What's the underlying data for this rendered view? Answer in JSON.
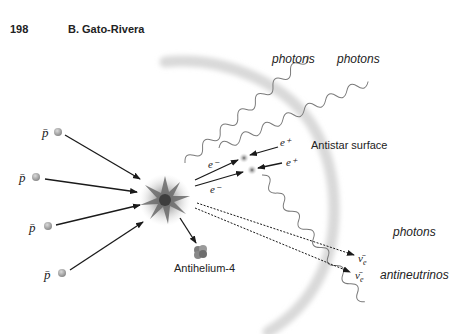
{
  "header": {
    "page_number": "198",
    "author": "B. Gato-Rivera"
  },
  "diagram": {
    "incoming_particles": [
      {
        "label": "p̄",
        "x": 47,
        "y": 135
      },
      {
        "label": "p̄",
        "x": 25,
        "y": 176
      },
      {
        "label": "p̄",
        "x": 35,
        "y": 227
      },
      {
        "label": "p̄",
        "x": 50,
        "y": 274
      }
    ],
    "annihilation_center": {
      "x": 165,
      "y": 200
    },
    "product": {
      "label": "Antihelium-4"
    },
    "electrons": [
      {
        "label": "e⁻",
        "x": 210,
        "y": 166
      },
      {
        "label": "e⁻",
        "x": 210,
        "y": 192
      }
    ],
    "positrons": [
      {
        "label": "e⁺",
        "x": 280,
        "y": 145
      },
      {
        "label": "e⁺",
        "x": 283,
        "y": 165
      }
    ],
    "surface_label": "Antistar surface",
    "photon_labels": [
      {
        "label": "photons",
        "x": 272,
        "y": 63
      },
      {
        "label": "photons",
        "x": 337,
        "y": 63
      },
      {
        "label": "photons",
        "x": 393,
        "y": 236
      }
    ],
    "neutrino_labels": [
      {
        "label": "ν̄",
        "sub": "e",
        "x": 356,
        "y": 256
      },
      {
        "label": "ν̄",
        "sub": "e",
        "x": 353,
        "y": 275
      }
    ],
    "antineutrinos_label": "antineutrinos",
    "colors": {
      "arrow": "#1a1a1a",
      "sphere": "#a8a8a8",
      "photon_wave": "#777777",
      "surface_arc": "#dcdcdc",
      "star_core": "#4a4a4a"
    }
  }
}
